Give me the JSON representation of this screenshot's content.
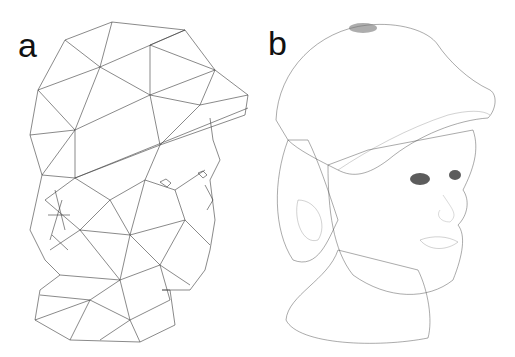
{
  "figure": {
    "panels": [
      {
        "label": "a",
        "description": "Coarse triangulated wireframe mesh of a sculpted head wearing a cap"
      },
      {
        "label": "b",
        "description": "Fine quadrilateral wireframe mesh of the same head wearing a cap"
      }
    ],
    "colors": {
      "background": "#ffffff",
      "line": "#3a3a3a",
      "label": "#111111"
    }
  }
}
